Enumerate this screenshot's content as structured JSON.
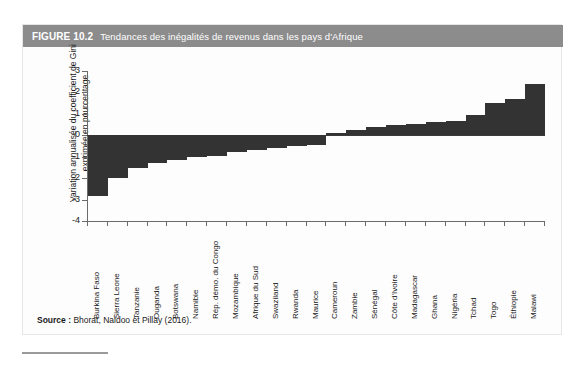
{
  "figure": {
    "number": "FIGURE 10.2",
    "title": "Tendances des inégalités de revenus dans les pays d'Afrique",
    "header_bg": "#8c8c8c",
    "header_text_color": "#ffffff"
  },
  "source": {
    "label": "Source :",
    "text": "Bhorat, Naidoo et Pillay (2016)."
  },
  "chart_data": {
    "type": "bar",
    "title": "Tendances des inégalités de revenus dans les pays d'Afrique",
    "xlabel": "",
    "ylabel": "Variation annualisée du coefficient de Gini exprimée en pourcentage",
    "ylim": [
      -4,
      3
    ],
    "yticks": [
      3,
      2,
      1,
      0,
      -1,
      -2,
      -3,
      -4
    ],
    "ytick_labels": [
      "3",
      "2",
      "1",
      "0",
      "-1",
      "-2",
      "-3",
      "-4"
    ],
    "grid": false,
    "legend": false,
    "bar_color": "#333333",
    "orientation": "vertical",
    "categories": [
      "Burkina Faso",
      "Sierra Leone",
      "Tanzanie",
      "Ouganda",
      "Botswana",
      "Namibie",
      "Rép. démo. du Congo",
      "Mozambique",
      "Afrique du Sud",
      "Swaziland",
      "Rwanda",
      "Maurice",
      "Cameroun",
      "Zambie",
      "Sénégal",
      "Côte d'Ivoire",
      "Madagascar",
      "Ghana",
      "Nigéria",
      "Tchad",
      "Togo",
      "Éthiopie",
      "Malawi"
    ],
    "values": [
      -2.85,
      -2.0,
      -1.55,
      -1.3,
      -1.15,
      -1.0,
      -0.95,
      -0.8,
      -0.7,
      -0.6,
      -0.5,
      -0.45,
      0.1,
      0.25,
      0.4,
      0.5,
      0.55,
      0.6,
      0.65,
      0.95,
      1.5,
      1.7,
      2.4
    ]
  }
}
